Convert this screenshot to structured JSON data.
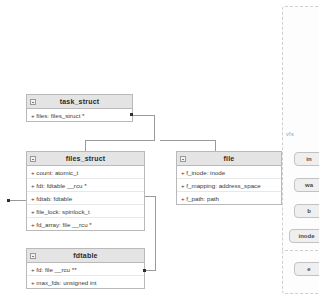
{
  "diagram": {
    "type": "uml-class-diagram",
    "background": "#ffffff",
    "header_fill": "#e4e4e4",
    "border_color": "#b9b9b9",
    "connector_color": "#9a9a9a"
  },
  "classes": [
    {
      "id": "task_struct",
      "name": "task_struct",
      "x": 26,
      "y": 94,
      "w": 107,
      "attributes": [
        "+ files: files_struct *"
      ]
    },
    {
      "id": "files_struct",
      "name": "files_struct",
      "x": 26,
      "y": 151,
      "w": 119,
      "attributes": [
        "+ count: atomic_t",
        "+ fdt: fdtable __rcu *",
        "+ fdtab: fdtable",
        "+ file_lock: spinlock_t",
        "+ fd_array: file __rcu *"
      ]
    },
    {
      "id": "file",
      "name": "file",
      "x": 176,
      "y": 151,
      "w": 106,
      "attributes": [
        "+ f_inode: inode",
        "+ f_mapping: address_space",
        "+ f_path: path"
      ]
    },
    {
      "id": "fdtable",
      "name": "fdtable",
      "x": 26,
      "y": 248,
      "w": 119,
      "attributes": [
        "+ fd: file __rcu **",
        "+ max_fds: unsigned int"
      ]
    }
  ],
  "connectors": [
    {
      "id": "task-to-files",
      "from": "task_struct",
      "to": "files_struct"
    },
    {
      "id": "files-to-fdtable",
      "from": "files_struct",
      "to": "fdtable"
    },
    {
      "id": "files-to-file",
      "from": "files_struct",
      "to": "file"
    }
  ],
  "right_panel": {
    "label": "vfs",
    "nodes": [
      {
        "id": "node-1",
        "label": "in",
        "x": 294,
        "y": 152,
        "w": 30
      },
      {
        "id": "node-2",
        "label": "wa",
        "x": 294,
        "y": 178,
        "w": 30
      },
      {
        "id": "node-3",
        "label": "b",
        "x": 294,
        "y": 204,
        "w": 30
      },
      {
        "id": "node-4",
        "label": "inode",
        "x": 289,
        "y": 229,
        "w": 35
      },
      {
        "id": "node-5",
        "label": "e",
        "x": 294,
        "y": 262,
        "w": 30
      }
    ]
  }
}
